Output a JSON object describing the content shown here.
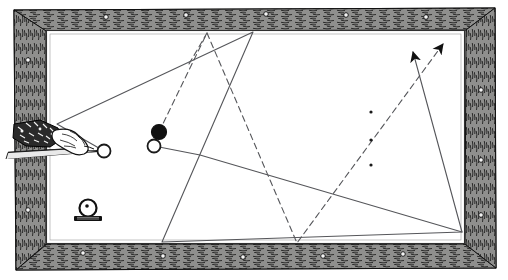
{
  "figure": {
    "kind": "billiards-table-diagram",
    "style": "vintage line engraving",
    "background_color": "#ffffff",
    "ink_color": "#1a1a1a",
    "line_color": "#55565a",
    "width": 508,
    "height": 280
  },
  "table": {
    "frame": {
      "name": "wooden-rail-frame",
      "color": "#2b2b2b",
      "outer": {
        "x": 14,
        "y": 8,
        "width": 482,
        "height": 262
      },
      "inner": {
        "x": 44,
        "y": 30,
        "width": 422,
        "height": 214
      },
      "texture": "wood-grain-hatching"
    },
    "cloth": {
      "name": "table-cloth",
      "color": "#ffffff",
      "polygon": "47,31 464,31 464,243 47,243"
    },
    "rail_studs": [
      {
        "x": 83,
        "y": 253
      },
      {
        "x": 163,
        "y": 256
      },
      {
        "x": 243,
        "y": 257
      },
      {
        "x": 323,
        "y": 256
      },
      {
        "x": 403,
        "y": 254
      },
      {
        "x": 106,
        "y": 17
      },
      {
        "x": 186,
        "y": 15
      },
      {
        "x": 266,
        "y": 14
      },
      {
        "x": 346,
        "y": 15
      },
      {
        "x": 426,
        "y": 17
      },
      {
        "x": 28,
        "y": 60
      },
      {
        "x": 28,
        "y": 140
      },
      {
        "x": 28,
        "y": 210
      },
      {
        "x": 481,
        "y": 90
      },
      {
        "x": 481,
        "y": 160
      },
      {
        "x": 481,
        "y": 215
      }
    ]
  },
  "spots": {
    "name": "table-spot-markers",
    "color": "#1a1a1a",
    "radius": 1.6,
    "points": [
      {
        "x": 371,
        "y": 112
      },
      {
        "x": 371,
        "y": 140
      },
      {
        "x": 371,
        "y": 165
      }
    ]
  },
  "balls": [
    {
      "name": "cue-ball",
      "x": 104,
      "y": 151,
      "r": 6.5,
      "fill": "white",
      "stroke": "#1a1a1a",
      "label": "cue ball"
    },
    {
      "name": "object-ball-white",
      "x": 154,
      "y": 146,
      "r": 6.5,
      "fill": "white",
      "stroke": "#1a1a1a",
      "label": "object ball"
    },
    {
      "name": "object-ball-black",
      "x": 159,
      "y": 132,
      "r": 7.5,
      "fill": "#111111",
      "stroke": "#111111",
      "label": "red (dark) ball"
    }
  ],
  "ball_on_stand": {
    "name": "spotted-ball-on-base",
    "ball": {
      "x": 88,
      "y": 208,
      "r": 8.5
    },
    "center_dot": {
      "x": 87,
      "y": 206,
      "r": 1.8
    },
    "base": {
      "x": 74,
      "y": 216,
      "width": 28,
      "height": 5
    },
    "caption": ""
  },
  "cue": {
    "name": "cue-stick-and-hand",
    "stick_line": {
      "x1": 8,
      "y1": 158,
      "x2": 98,
      "y2": 151
    },
    "stick_line2": {
      "x1": 10,
      "y1": 152,
      "x2": 72,
      "y2": 148
    },
    "hand": {
      "x": 12,
      "y": 122,
      "width": 80,
      "height": 40,
      "label": "hand with shirt cuff gripping cue"
    }
  },
  "paths": {
    "solid": {
      "name": "solid-trajectory-path",
      "style": "solid",
      "stroke": "#55565a",
      "stroke_width": 1.1,
      "description": "cue ball path with cushion rebounds, ending in arrow",
      "points": [
        {
          "x": 104,
          "y": 151
        },
        {
          "x": 57,
          "y": 124
        },
        {
          "x": 253,
          "y": 32
        },
        {
          "x": 162,
          "y": 242
        },
        {
          "x": 462,
          "y": 232
        },
        {
          "x": 413,
          "y": 52
        }
      ],
      "arrow_tip": {
        "x": 413,
        "y": 52
      },
      "arrow_angle_deg": -75
    },
    "solid_branch": {
      "name": "solid-branch-path",
      "style": "solid",
      "stroke": "#55565a",
      "stroke_width": 1.1,
      "description": "secondary solid line from object ball to lower right cushion",
      "points": [
        {
          "x": 154,
          "y": 146
        },
        {
          "x": 200,
          "y": 155
        },
        {
          "x": 462,
          "y": 232
        }
      ]
    },
    "dashed": {
      "name": "dashed-trajectory-path",
      "style": "dashed",
      "stroke": "#55565a",
      "stroke_width": 1.1,
      "dash_array": "6 4",
      "description": "object ball path with cushion rebounds, ending in arrow",
      "points": [
        {
          "x": 159,
          "y": 132
        },
        {
          "x": 207,
          "y": 33
        },
        {
          "x": 297,
          "y": 243
        },
        {
          "x": 443,
          "y": 44
        }
      ],
      "arrow_tip": {
        "x": 443,
        "y": 44
      },
      "arrow_angle_deg": -54
    },
    "dashed_short": {
      "name": "dashed-short-segment",
      "style": "dashed",
      "stroke": "#55565a",
      "stroke_width": 1.1,
      "dash_array": "6 4",
      "points": [
        {
          "x": 189,
          "y": 64
        },
        {
          "x": 207,
          "y": 33
        }
      ]
    }
  },
  "arrows": [
    {
      "name": "solid-path-arrowhead",
      "tip_x": 413,
      "tip_y": 52,
      "rotation": -62
    },
    {
      "name": "dashed-path-arrowhead",
      "tip_x": 443,
      "tip_y": 44,
      "rotation": -55
    }
  ]
}
